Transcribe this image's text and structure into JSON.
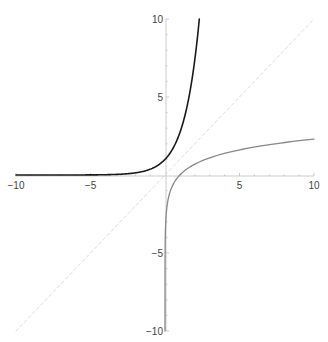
{
  "chart_data": {
    "type": "line",
    "title": "",
    "xlabel": "",
    "ylabel": "",
    "xlim": [
      -10,
      10
    ],
    "ylim": [
      -10,
      10
    ],
    "grid": false,
    "legend": null,
    "axes_origin": [
      0,
      0
    ],
    "x_ticks": [
      -10,
      -5,
      5,
      10
    ],
    "y_ticks": [
      -10,
      -5,
      5,
      10
    ],
    "x_tick_labels": [
      "−10",
      "−5",
      "5",
      "10"
    ],
    "y_tick_labels": [
      "−10",
      "−5",
      "5",
      "10"
    ],
    "series": [
      {
        "name": "exp(x)",
        "color": "#1a1a1a",
        "style": "solid",
        "x": [
          -10,
          -8,
          -6,
          -4,
          -3,
          -2,
          -1,
          -0.5,
          0,
          0.5,
          1,
          1.5,
          2,
          2.303
        ],
        "y": [
          4.54e-05,
          0.000335,
          0.00248,
          0.0183,
          0.0498,
          0.135,
          0.368,
          0.607,
          1,
          1.649,
          2.718,
          4.482,
          7.389,
          10
        ]
      },
      {
        "name": "log(x)",
        "color": "#888888",
        "style": "solid",
        "x": [
          4.54e-05,
          0.001,
          0.01,
          0.05,
          0.1,
          0.25,
          0.5,
          1,
          2,
          3,
          5,
          7,
          10
        ],
        "y": [
          -10,
          -6.908,
          -4.605,
          -2.996,
          -2.303,
          -1.386,
          -0.693,
          0,
          0.693,
          1.099,
          1.609,
          1.946,
          2.303
        ]
      },
      {
        "name": "y = x",
        "color": "#d9d9d9",
        "style": "dashed",
        "x": [
          -10,
          10
        ],
        "y": [
          -10,
          10
        ]
      }
    ]
  },
  "colors": {
    "axis": "#cccccc",
    "tick_label": "#444444",
    "background": "#ffffff"
  }
}
